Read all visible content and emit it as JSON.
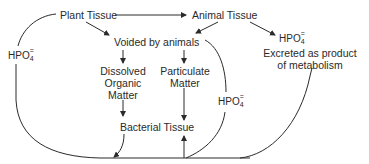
{
  "diagram": {
    "title": "",
    "nodes": {
      "plant_tissue": {
        "label": "Plant Tissue"
      },
      "animal_tissue": {
        "label": "Animal Tissue"
      },
      "voided_by_animals": {
        "label": "Voided by animals"
      },
      "dissolved_organic_matter": {
        "line1": "Dissolved",
        "line2": "Organic",
        "line3": "Matter"
      },
      "particulate_matter": {
        "line1": "Particulate",
        "line2": "Matter"
      },
      "bacterial_tissue": {
        "label": "Bacterial Tissue"
      },
      "excreted": {
        "line1": "Excreted as product",
        "line2": "of metabolism"
      }
    },
    "phosphate_labels": {
      "left": {
        "base": "HPO",
        "sub": "4",
        "sup": "="
      },
      "middle": {
        "base": "HPO",
        "sub": "4",
        "sup": "="
      },
      "right": {
        "base": "HPO",
        "sub": "4",
        "sup": "="
      }
    },
    "edges": [
      {
        "from": "Plant Tissue",
        "to": "Animal Tissue"
      },
      {
        "from": "Plant Tissue",
        "to": "Voided by animals"
      },
      {
        "from": "Animal Tissue",
        "to": "Voided by animals"
      },
      {
        "from": "Animal Tissue",
        "to": "HPO4= (excreted)"
      },
      {
        "from": "Voided by animals",
        "to": "Dissolved Organic Matter"
      },
      {
        "from": "Voided by animals",
        "to": "Particulate Matter"
      },
      {
        "from": "Dissolved Organic Matter",
        "to": "Bacterial Tissue"
      },
      {
        "from": "Particulate Matter",
        "to": "Bacterial Tissue"
      },
      {
        "from": "Bacterial Tissue",
        "to": "phosphate pool (bottom line)"
      },
      {
        "from": "phosphate pool (bottom line)",
        "to": "Bacterial Tissue"
      },
      {
        "from": "Plant Tissue",
        "to": "phosphate pool via HPO4="
      },
      {
        "from": "Voided by animals",
        "to": "phosphate pool via HPO4="
      },
      {
        "from": "Excreted as product of metabolism",
        "to": "phosphate pool"
      }
    ],
    "colors": {
      "line": "#2a2a2a",
      "text": "#2a2a2a",
      "background": "#ffffff"
    }
  }
}
